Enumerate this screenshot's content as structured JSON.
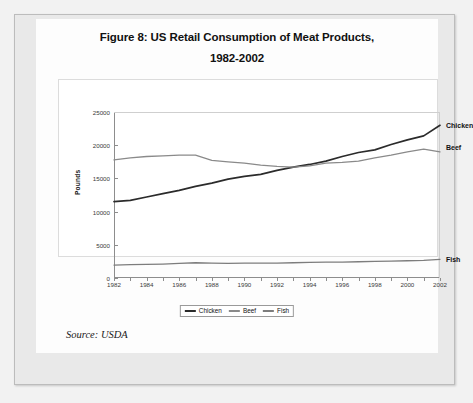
{
  "figure": {
    "title_line1": "Figure 8: US Retail Consumption of Meat Products,",
    "title_line2": "1982-2002",
    "source_note": "Source: USDA"
  },
  "axes": {
    "ylabel": "Pounds",
    "yticks": [
      "0",
      "5000",
      "10000",
      "15000",
      "20000",
      "25000"
    ],
    "xticks": [
      "1982",
      "1984",
      "1986",
      "1988",
      "1990",
      "1992",
      "1994",
      "1996",
      "1998",
      "2000",
      "2002"
    ]
  },
  "legend": {
    "items": [
      {
        "label": "Chicken",
        "color": "#2b2b2b"
      },
      {
        "label": "Beef",
        "color": "#8a8a8a"
      },
      {
        "label": "Fish",
        "color": "#7d7d7d"
      }
    ]
  },
  "callouts": [
    {
      "label": "Chicken",
      "value": 23000
    },
    {
      "label": "Beef",
      "value": 19700
    },
    {
      "label": "Fish",
      "value": 2800
    }
  ],
  "chart_data": {
    "type": "line",
    "title": "Figure 8: US Retail Consumption of Meat Products, 1982-2002",
    "xlabel": "",
    "ylabel": "Pounds",
    "xlim": [
      1982,
      2002
    ],
    "ylim": [
      0,
      25000
    ],
    "grid": false,
    "legend_position": "bottom",
    "x": [
      1982,
      1983,
      1984,
      1985,
      1986,
      1987,
      1988,
      1989,
      1990,
      1991,
      1992,
      1993,
      1994,
      1995,
      1996,
      1997,
      1998,
      1999,
      2000,
      2001,
      2002
    ],
    "series": [
      {
        "name": "Chicken",
        "color": "#2b2b2b",
        "values": [
          11500,
          11700,
          12200,
          12700,
          13200,
          13800,
          14300,
          14900,
          15300,
          15600,
          16200,
          16700,
          17100,
          17600,
          18300,
          18900,
          19300,
          20100,
          20800,
          21400,
          23000
        ]
      },
      {
        "name": "Beef",
        "color": "#8a8a8a",
        "values": [
          17800,
          18100,
          18300,
          18400,
          18500,
          18500,
          17700,
          17500,
          17300,
          17000,
          16800,
          16700,
          16900,
          17300,
          17400,
          17600,
          18100,
          18500,
          19000,
          19400,
          19000
        ]
      },
      {
        "name": "Fish",
        "color": "#7d7d7d",
        "values": [
          1950,
          2000,
          2050,
          2100,
          2200,
          2300,
          2250,
          2200,
          2250,
          2250,
          2250,
          2300,
          2350,
          2400,
          2400,
          2450,
          2500,
          2550,
          2600,
          2650,
          2800
        ]
      }
    ]
  }
}
